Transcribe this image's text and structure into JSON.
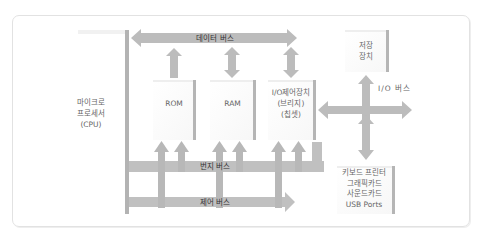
{
  "diagram": {
    "title": "",
    "nodes": {
      "cpu": {
        "line1": "마이크로",
        "line2": "프로세서",
        "line3": "(CPU)"
      },
      "rom": {
        "label": "ROM"
      },
      "ram": {
        "label": "RAM"
      },
      "io_controller": {
        "line1": "I/O제어장치",
        "line2": "(브리지)",
        "line3": "(칩셋)"
      },
      "storage": {
        "line1": "저장",
        "line2": "장치"
      },
      "peripherals": {
        "line1": "키보드 프린터",
        "line2": "그래픽카드",
        "line3": "사운드카드",
        "line4": "USB Ports"
      }
    },
    "buses": {
      "data_bus": "데이터 버스",
      "address_bus": "번지 버스",
      "control_bus": "제어 버스",
      "io_bus": "I/O 버스"
    },
    "colors": {
      "arrow": "#b9b9b9",
      "box_edge": "#b0b0b0",
      "border": "#e2e2e2"
    }
  }
}
